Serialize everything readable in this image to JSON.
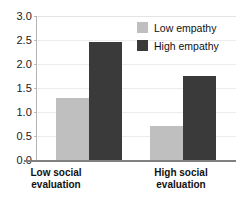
{
  "chart_data": {
    "type": "bar",
    "title": "",
    "xlabel": "",
    "ylabel": "",
    "ylim": [
      0,
      3.0
    ],
    "grid": true,
    "legend_position": "top-right",
    "categories": [
      "Low social evaluation",
      "High social evaluation"
    ],
    "category_lines": [
      [
        "Low social",
        "evaluation"
      ],
      [
        "High social",
        "evaluation"
      ]
    ],
    "yticks": [
      "3.0",
      "2.5",
      "2.0",
      "1.5",
      "1.0",
      "0.5",
      "0.0"
    ],
    "ytick_values": [
      3.0,
      2.5,
      2.0,
      1.5,
      1.0,
      0.5,
      0.0
    ],
    "series": [
      {
        "name": "Low empathy",
        "color": "#bfbfbf",
        "values": [
          1.3,
          0.71
        ]
      },
      {
        "name": "High empathy",
        "color": "#3a3a3a",
        "values": [
          2.45,
          1.74
        ]
      }
    ]
  },
  "legend": {
    "items": [
      {
        "label": "Low empathy",
        "color": "#bfbfbf"
      },
      {
        "label": "High empathy",
        "color": "#3a3a3a"
      }
    ]
  },
  "colors": {
    "low_empathy": "#bfbfbf",
    "high_empathy": "#3a3a3a",
    "gridline": "#ececec",
    "axis": "#808080",
    "text": "#111111",
    "background": "#ffffff"
  }
}
